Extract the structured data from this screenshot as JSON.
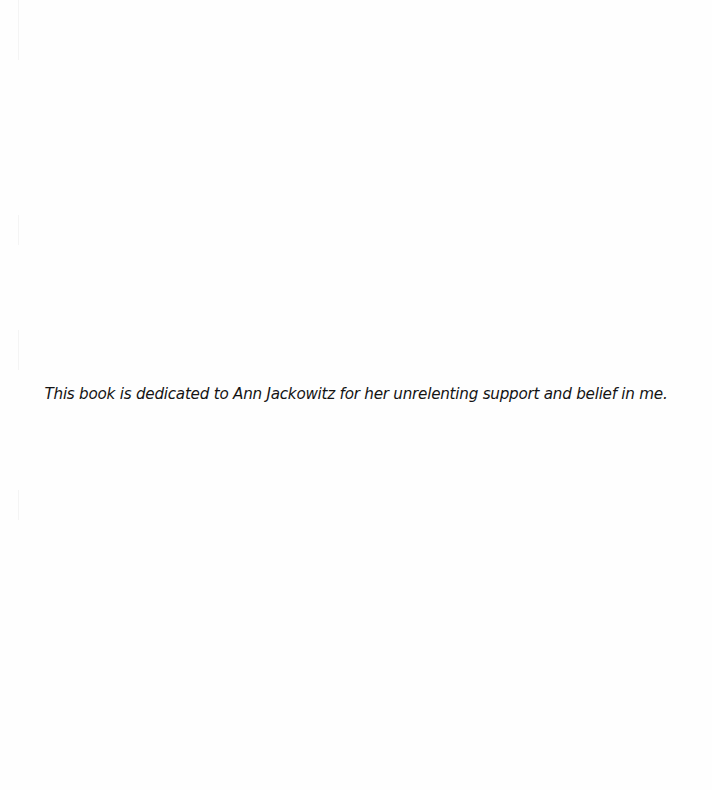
{
  "page": {
    "type": "dedication",
    "dedication_text": "This book is dedicated to Ann Jackowitz for her unrelenting support and belief in me."
  }
}
